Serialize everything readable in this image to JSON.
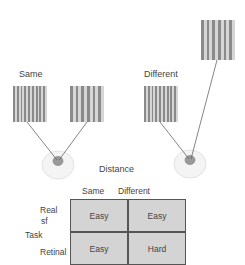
{
  "diagram": {
    "conditions": {
      "same_label": "Same",
      "different_label": "Different"
    },
    "distance_label": "Distance",
    "table": {
      "col_headers": [
        "Same",
        "Different"
      ],
      "row_axis_label": "Task",
      "row_headers": [
        "Real sf",
        "Retinal"
      ],
      "row_header_lines": [
        [
          "Real",
          "sf"
        ],
        [
          "Retinal"
        ]
      ],
      "cells": [
        [
          "Easy",
          "Easy"
        ],
        [
          "Easy",
          "Hard"
        ]
      ]
    },
    "colors": {
      "stripe_dark": "#8a8a8a",
      "stripe_light": "#d6d6d6",
      "cell_fill": "#d4d4d4",
      "eye_fill": "#f4f4f4",
      "pupil_fill": "#9a9a9a",
      "line": "#666666"
    }
  }
}
